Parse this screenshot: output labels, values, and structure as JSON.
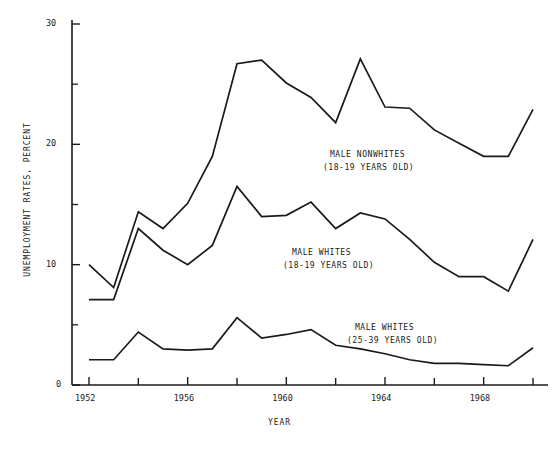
{
  "chart_data": {
    "type": "line",
    "title": "",
    "xlabel": "YEAR",
    "ylabel": "UNEMPLOYMENT RATES, PERCENT",
    "xlim": [
      1951.4,
      1970.4
    ],
    "ylim": [
      0,
      30
    ],
    "grid": false,
    "legend_position": "inline-annotations",
    "x_ticks_major": [
      1952,
      1956,
      1960,
      1964,
      1968
    ],
    "x_ticks_all": [
      1952,
      1954,
      1956,
      1958,
      1960,
      1962,
      1964,
      1966,
      1968,
      1970
    ],
    "x_tick_labels": [
      "1952",
      "1956",
      "1960",
      "1964",
      "1968"
    ],
    "y_ticks_major": [
      0,
      10,
      20,
      30
    ],
    "y_ticks_minor": [
      5,
      15,
      25
    ],
    "y_tick_labels": [
      "0",
      "10",
      "20",
      "30"
    ],
    "x": [
      1952,
      1953,
      1954,
      1955,
      1956,
      1957,
      1958,
      1959,
      1960,
      1961,
      1962,
      1963,
      1964,
      1965,
      1966,
      1967,
      1968,
      1969,
      1970
    ],
    "series": [
      {
        "name": "MALE NONWHITES (18-19 YEARS OLD)",
        "label_line1": "MALE NONWHITES",
        "label_line2": "(18-19 YEARS OLD)",
        "color": "#1a1a1a",
        "values": [
          10.0,
          8.1,
          14.4,
          13.0,
          15.1,
          19.0,
          26.7,
          27.0,
          25.1,
          23.9,
          21.8,
          27.1,
          23.1,
          23.0,
          21.2,
          20.1,
          19.0,
          19.0,
          22.9
        ]
      },
      {
        "name": "MALE WHITES (18-19 YEARS OLD)",
        "label_line1": "MALE WHITES",
        "label_line2": "(18-19 YEARS OLD)",
        "color": "#1a1a1a",
        "values": [
          7.1,
          7.1,
          13.0,
          11.2,
          10.0,
          11.6,
          16.5,
          14.0,
          14.1,
          15.2,
          13.0,
          14.3,
          13.8,
          12.1,
          10.2,
          9.0,
          9.0,
          7.8,
          12.1
        ]
      },
      {
        "name": "MALE WHITES (25-39 YEARS OLD)",
        "label_line1": "MALE WHITES",
        "label_line2": "(25-39 YEARS OLD)",
        "color": "#1a1a1a",
        "values": [
          2.1,
          2.1,
          4.4,
          3.0,
          2.9,
          3.0,
          5.6,
          3.9,
          4.2,
          4.6,
          3.3,
          3.0,
          2.6,
          2.1,
          1.8,
          1.8,
          1.7,
          1.6,
          3.1
        ]
      }
    ],
    "annotations": [
      {
        "text": "MALE NONWHITES",
        "x": 330,
        "y": 148
      },
      {
        "text": "(18-19 YEARS OLD)",
        "x": 323,
        "y": 161
      },
      {
        "text": "MALE WHITES",
        "x": 292,
        "y": 246
      },
      {
        "text": "(18-19 YEARS OLD)",
        "x": 283,
        "y": 259
      },
      {
        "text": "MALE WHITES",
        "x": 355,
        "y": 321
      },
      {
        "text": "(25-39 YEARS OLD)",
        "x": 347,
        "y": 334
      }
    ]
  }
}
